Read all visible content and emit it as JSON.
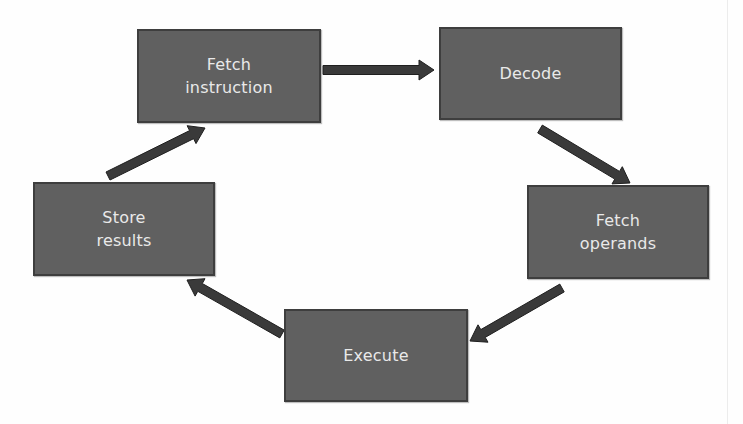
{
  "diagram": {
    "type": "cycle-flowchart",
    "title": "",
    "colors": {
      "background": "#ffffff",
      "box_fill": "#606060",
      "box_border": "#3e3e3e",
      "box_text": "#e9e9e9",
      "arrow": "#3a3a3a"
    },
    "nodes": [
      {
        "id": "fetch_instruction",
        "label": "Fetch\ninstruction",
        "x": 137,
        "y": 29,
        "w": 184,
        "h": 94
      },
      {
        "id": "decode",
        "label": "Decode",
        "x": 439,
        "y": 27,
        "w": 183,
        "h": 93
      },
      {
        "id": "fetch_operands",
        "label": "Fetch\noperands",
        "x": 527,
        "y": 185,
        "w": 182,
        "h": 94
      },
      {
        "id": "execute",
        "label": "Execute",
        "x": 284,
        "y": 309,
        "w": 184,
        "h": 93
      },
      {
        "id": "store_results",
        "label": "Store\nresults",
        "x": 33,
        "y": 182,
        "w": 182,
        "h": 94
      }
    ],
    "edges": [
      {
        "from": "fetch_instruction",
        "to": "decode",
        "x1": 323,
        "y1": 70,
        "x2": 434,
        "y2": 70
      },
      {
        "from": "decode",
        "to": "fetch_operands",
        "x1": 540,
        "y1": 129,
        "x2": 630,
        "y2": 183
      },
      {
        "from": "fetch_operands",
        "to": "execute",
        "x1": 562,
        "y1": 288,
        "x2": 470,
        "y2": 341
      },
      {
        "from": "execute",
        "to": "store_results",
        "x1": 282,
        "y1": 334,
        "x2": 187,
        "y2": 280
      },
      {
        "from": "store_results",
        "to": "fetch_instruction",
        "x1": 108,
        "y1": 176,
        "x2": 205,
        "y2": 128
      }
    ]
  }
}
